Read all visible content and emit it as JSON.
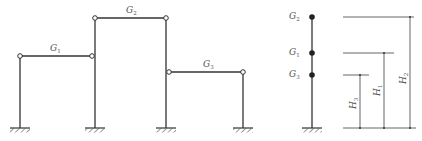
{
  "diagram": {
    "type": "structural frame and equivalent lumped-mass model",
    "colors": {
      "line": "#333333",
      "dim_line": "#555555",
      "background": "#ffffff"
    },
    "frame": {
      "beams": [
        {
          "id": "G1",
          "label": "G",
          "sub": "1"
        },
        {
          "id": "G2",
          "label": "G",
          "sub": "2"
        },
        {
          "id": "G3",
          "label": "G",
          "sub": "3"
        }
      ],
      "supports": "fixed",
      "joints": "hinged"
    },
    "stick_model": {
      "masses": [
        {
          "label": "G",
          "sub": "2"
        },
        {
          "label": "G",
          "sub": "1"
        },
        {
          "label": "G",
          "sub": "3"
        }
      ]
    },
    "dimensions": [
      {
        "label": "H",
        "sub": "3"
      },
      {
        "label": "H",
        "sub": "1"
      },
      {
        "label": "H",
        "sub": "2"
      }
    ]
  }
}
